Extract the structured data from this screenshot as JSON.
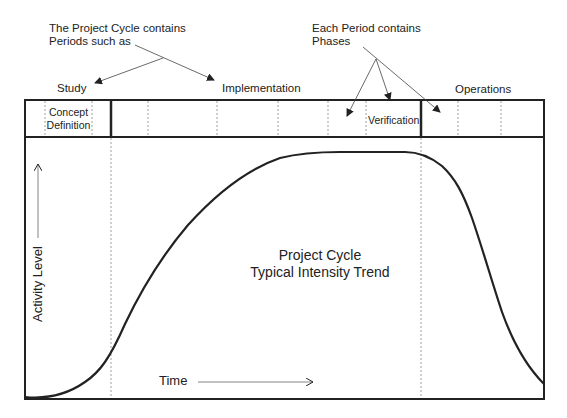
{
  "annotations": {
    "periods_note": [
      "The Project Cycle contains",
      "Periods such as"
    ],
    "phases_note": [
      "Each Period contains",
      "Phases"
    ]
  },
  "periods": [
    {
      "label": "Study"
    },
    {
      "label": "Implementation"
    },
    {
      "label": "Operations"
    }
  ],
  "phases": {
    "concept": [
      "Concept",
      "Definition"
    ],
    "verification": "Verification"
  },
  "chart": {
    "title_line1": "Project Cycle",
    "title_line2": "Typical Intensity Trend",
    "ylabel": "Activity Level",
    "xlabel": "Time"
  },
  "colors": {
    "line": "#222222",
    "divider": "#888888"
  }
}
